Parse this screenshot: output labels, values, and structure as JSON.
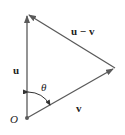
{
  "diagram": {
    "type": "vector-triangle",
    "colors": {
      "line": "#5a5a5a",
      "text": "#222222",
      "background": "#ffffff"
    },
    "points": {
      "origin": {
        "label": "O",
        "x": 27,
        "y": 118
      },
      "u_tip": {
        "x": 27,
        "y": 14
      },
      "v_tip": {
        "x": 115,
        "y": 68
      }
    },
    "vectors": [
      {
        "name": "u",
        "label": "u",
        "from": "origin",
        "to": "u_tip"
      },
      {
        "name": "v",
        "label": "v",
        "from": "origin",
        "to": "v_tip"
      },
      {
        "name": "u-v",
        "label": "u − v",
        "from": "v_tip",
        "to": "u_tip"
      }
    ],
    "angle": {
      "label": "θ",
      "between": [
        "u",
        "v"
      ]
    },
    "labels": {
      "u": "u",
      "v": "v",
      "u_minus_v": "u − v",
      "theta": "θ",
      "origin": "O"
    }
  }
}
